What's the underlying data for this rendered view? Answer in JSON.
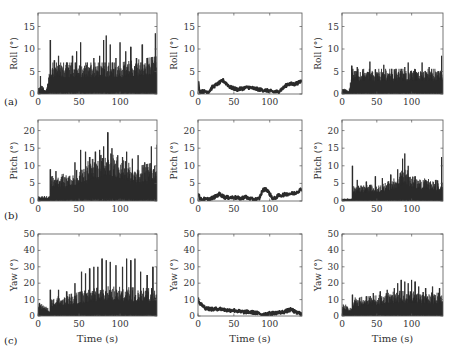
{
  "chart_data": [
    {
      "id": "a1",
      "row": "a",
      "type": "line",
      "ylabel": "Roll (°)",
      "xlabel": "",
      "ylim": [
        0,
        18
      ],
      "yticks": [
        0,
        5,
        10,
        15
      ],
      "xticks": [
        0,
        50,
        100
      ],
      "xlim": [
        0,
        145
      ],
      "style": "spiky",
      "base": [
        [
          0,
          1
        ],
        [
          5,
          1.5
        ],
        [
          10,
          0.5
        ],
        [
          15,
          5
        ],
        [
          60,
          5
        ],
        [
          100,
          5
        ],
        [
          145,
          6
        ]
      ],
      "peaks": [
        [
          3,
          4
        ],
        [
          15,
          12
        ],
        [
          20,
          7.5
        ],
        [
          25,
          8.5
        ],
        [
          35,
          7
        ],
        [
          42,
          8.5
        ],
        [
          47,
          9.5
        ],
        [
          52,
          11.5
        ],
        [
          60,
          7
        ],
        [
          68,
          8
        ],
        [
          75,
          8.5
        ],
        [
          80,
          12
        ],
        [
          83,
          13
        ],
        [
          88,
          11
        ],
        [
          95,
          8
        ],
        [
          100,
          11.5
        ],
        [
          107,
          9.5
        ],
        [
          113,
          10.5
        ],
        [
          120,
          8
        ],
        [
          127,
          11
        ],
        [
          133,
          8
        ],
        [
          143,
          13.5
        ]
      ]
    },
    {
      "id": "a2",
      "row": "a",
      "type": "line",
      "ylabel": "Roll (°)",
      "xlabel": "",
      "ylim": [
        0,
        18
      ],
      "yticks": [
        0,
        5,
        10,
        15
      ],
      "xticks": [
        0,
        50,
        100
      ],
      "xlim": [
        0,
        145
      ],
      "style": "smooth",
      "points": [
        [
          0,
          3
        ],
        [
          2,
          0.6
        ],
        [
          15,
          0.5
        ],
        [
          20,
          1.5
        ],
        [
          30,
          2.5
        ],
        [
          35,
          3
        ],
        [
          45,
          1.5
        ],
        [
          55,
          1
        ],
        [
          70,
          1.5
        ],
        [
          85,
          1
        ],
        [
          95,
          0.8
        ],
        [
          105,
          0.5
        ],
        [
          112,
          0.5
        ],
        [
          120,
          1.5
        ],
        [
          125,
          2.2
        ],
        [
          135,
          2.2
        ],
        [
          140,
          2.5
        ],
        [
          145,
          3
        ]
      ]
    },
    {
      "id": "a3",
      "row": "a",
      "type": "line",
      "ylabel": "Roll (°)",
      "xlabel": "",
      "ylim": [
        0,
        18
      ],
      "yticks": [
        0,
        5,
        10,
        15
      ],
      "xticks": [
        0,
        50,
        100
      ],
      "xlim": [
        0,
        145
      ],
      "style": "spiky",
      "base": [
        [
          0,
          1
        ],
        [
          10,
          0.5
        ],
        [
          14,
          4
        ],
        [
          60,
          4
        ],
        [
          145,
          4
        ]
      ],
      "peaks": [
        [
          14,
          6.3
        ],
        [
          22,
          6
        ],
        [
          30,
          5.5
        ],
        [
          40,
          7.2
        ],
        [
          48,
          5.5
        ],
        [
          60,
          6.5
        ],
        [
          75,
          5.5
        ],
        [
          90,
          6
        ],
        [
          95,
          7
        ],
        [
          105,
          5.5
        ],
        [
          115,
          7
        ],
        [
          125,
          6
        ],
        [
          143,
          8.5
        ]
      ]
    },
    {
      "id": "b1",
      "row": "b",
      "type": "line",
      "ylabel": "Pitch (°)",
      "xlabel": "",
      "ylim": [
        0,
        23
      ],
      "yticks": [
        0,
        5,
        10,
        15,
        20
      ],
      "xticks": [
        0,
        50,
        100
      ],
      "xlim": [
        0,
        145
      ],
      "style": "spiky",
      "base": [
        [
          0,
          1
        ],
        [
          14,
          1
        ],
        [
          16,
          5
        ],
        [
          45,
          6
        ],
        [
          60,
          8
        ],
        [
          85,
          10
        ],
        [
          95,
          9
        ],
        [
          120,
          7
        ],
        [
          145,
          8
        ]
      ],
      "peaks": [
        [
          15,
          9
        ],
        [
          22,
          8.5
        ],
        [
          30,
          7
        ],
        [
          38,
          7
        ],
        [
          45,
          11
        ],
        [
          52,
          14.5
        ],
        [
          58,
          14
        ],
        [
          63,
          12.5
        ],
        [
          70,
          14
        ],
        [
          75,
          14.5
        ],
        [
          80,
          15.5
        ],
        [
          85,
          19.5
        ],
        [
          90,
          15
        ],
        [
          97,
          13
        ],
        [
          103,
          12.5
        ],
        [
          108,
          14
        ],
        [
          115,
          12
        ],
        [
          122,
          13
        ],
        [
          130,
          11
        ],
        [
          138,
          15.5
        ],
        [
          145,
          16
        ]
      ]
    },
    {
      "id": "b2",
      "row": "b",
      "type": "line",
      "ylabel": "Pitch (°)",
      "xlabel": "",
      "ylim": [
        0,
        23
      ],
      "yticks": [
        0,
        5,
        10,
        15,
        20
      ],
      "xticks": [
        0,
        50,
        100
      ],
      "xlim": [
        0,
        145
      ],
      "style": "smooth",
      "points": [
        [
          0,
          2.5
        ],
        [
          3,
          0.5
        ],
        [
          15,
          0.5
        ],
        [
          22,
          1
        ],
        [
          30,
          2
        ],
        [
          38,
          1
        ],
        [
          50,
          1
        ],
        [
          60,
          0.7
        ],
        [
          65,
          1.2
        ],
        [
          75,
          0.5
        ],
        [
          85,
          0.5
        ],
        [
          90,
          3
        ],
        [
          95,
          3.5
        ],
        [
          100,
          2
        ],
        [
          105,
          0.5
        ],
        [
          112,
          1.5
        ],
        [
          125,
          2
        ],
        [
          135,
          2.2
        ],
        [
          145,
          3.5
        ]
      ]
    },
    {
      "id": "b3",
      "row": "b",
      "type": "line",
      "ylabel": "Pitch (°)",
      "xlabel": "",
      "ylim": [
        0,
        23
      ],
      "yticks": [
        0,
        5,
        10,
        15,
        20
      ],
      "xticks": [
        0,
        50,
        100
      ],
      "xlim": [
        0,
        145
      ],
      "style": "spiky",
      "base": [
        [
          0,
          0.5
        ],
        [
          14,
          0.5
        ],
        [
          16,
          3
        ],
        [
          60,
          3.5
        ],
        [
          80,
          5
        ],
        [
          90,
          7
        ],
        [
          100,
          5
        ],
        [
          145,
          4
        ]
      ],
      "peaks": [
        [
          15,
          10
        ],
        [
          22,
          6
        ],
        [
          35,
          5.5
        ],
        [
          48,
          7
        ],
        [
          58,
          6.5
        ],
        [
          70,
          7.5
        ],
        [
          80,
          9
        ],
        [
          87,
          12
        ],
        [
          90,
          13.5
        ],
        [
          95,
          10
        ],
        [
          105,
          7
        ],
        [
          120,
          6
        ],
        [
          135,
          6
        ],
        [
          143,
          12.5
        ]
      ]
    },
    {
      "id": "c1",
      "row": "c",
      "type": "line",
      "ylabel": "Yaw (°)",
      "xlabel": "Time (s)",
      "ylim": [
        0,
        50
      ],
      "yticks": [
        0,
        10,
        20,
        30,
        40,
        50
      ],
      "xticks": [
        0,
        50,
        100
      ],
      "xlim": [
        0,
        145
      ],
      "style": "spiky",
      "base": [
        [
          0,
          7
        ],
        [
          10,
          4
        ],
        [
          14,
          3
        ],
        [
          16,
          8
        ],
        [
          45,
          10
        ],
        [
          80,
          13
        ],
        [
          145,
          12
        ]
      ],
      "peaks": [
        [
          2,
          8
        ],
        [
          15,
          16
        ],
        [
          25,
          16
        ],
        [
          35,
          15
        ],
        [
          45,
          20
        ],
        [
          53,
          27
        ],
        [
          58,
          26
        ],
        [
          63,
          29
        ],
        [
          68,
          30
        ],
        [
          73,
          30
        ],
        [
          78,
          35
        ],
        [
          83,
          34
        ],
        [
          88,
          33
        ],
        [
          95,
          31
        ],
        [
          103,
          30
        ],
        [
          108,
          35
        ],
        [
          113,
          34
        ],
        [
          118,
          35
        ],
        [
          125,
          27
        ],
        [
          133,
          25
        ],
        [
          140,
          30
        ],
        [
          145,
          30
        ]
      ]
    },
    {
      "id": "c2",
      "row": "c",
      "type": "line",
      "ylabel": "Yaw (°)",
      "xlabel": "Time (s)",
      "ylim": [
        0,
        50
      ],
      "yticks": [
        0,
        10,
        20,
        30,
        40,
        50
      ],
      "xticks": [
        0,
        50,
        100
      ],
      "xlim": [
        0,
        145
      ],
      "style": "smooth",
      "points": [
        [
          0,
          11
        ],
        [
          2,
          8
        ],
        [
          10,
          5
        ],
        [
          20,
          4
        ],
        [
          30,
          4.5
        ],
        [
          40,
          3.5
        ],
        [
          50,
          3.5
        ],
        [
          60,
          2.5
        ],
        [
          70,
          2.5
        ],
        [
          80,
          2
        ],
        [
          90,
          1
        ],
        [
          100,
          1.5
        ],
        [
          110,
          2
        ],
        [
          120,
          2.5
        ],
        [
          130,
          4
        ],
        [
          137,
          2
        ],
        [
          145,
          1.5
        ]
      ]
    },
    {
      "id": "c3",
      "row": "c",
      "type": "line",
      "ylabel": "Yaw (°)",
      "xlabel": "Time (s)",
      "ylim": [
        0,
        50
      ],
      "yticks": [
        0,
        10,
        20,
        30,
        40,
        50
      ],
      "xticks": [
        0,
        50,
        100
      ],
      "xlim": [
        0,
        145
      ],
      "style": "spiky",
      "base": [
        [
          0,
          6
        ],
        [
          10,
          4
        ],
        [
          14,
          3
        ],
        [
          16,
          8
        ],
        [
          50,
          9
        ],
        [
          80,
          11
        ],
        [
          145,
          10
        ]
      ],
      "peaks": [
        [
          15,
          13
        ],
        [
          25,
          11
        ],
        [
          35,
          12
        ],
        [
          45,
          14
        ],
        [
          55,
          15
        ],
        [
          65,
          16
        ],
        [
          75,
          17
        ],
        [
          80,
          20
        ],
        [
          85,
          22
        ],
        [
          90,
          21
        ],
        [
          95,
          20
        ],
        [
          100,
          22
        ],
        [
          105,
          21
        ],
        [
          110,
          18
        ],
        [
          120,
          17
        ],
        [
          130,
          18
        ],
        [
          140,
          17
        ]
      ]
    }
  ],
  "labels": {
    "panel_a": "(a)",
    "panel_b": "(b)",
    "panel_c": "(c)",
    "time_label": "Time (s)"
  },
  "colors": {
    "trace": "#2a2a2a",
    "axis": "#555555",
    "background": "#ffffff"
  }
}
